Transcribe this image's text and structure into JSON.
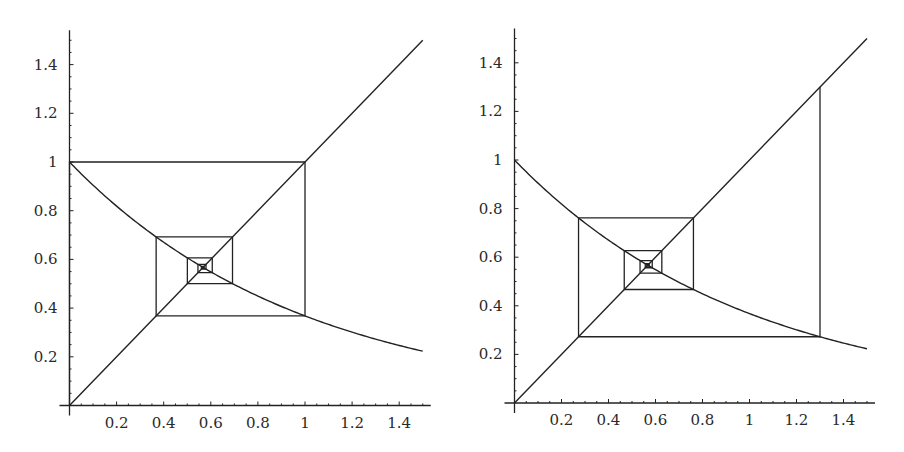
{
  "chart_data": [
    {
      "type": "line",
      "title": "",
      "xlabel": "",
      "ylabel": "",
      "xlim": [
        0,
        1.5
      ],
      "ylim": [
        0,
        1.5
      ],
      "grid": false,
      "x_ticks": [
        "0.2",
        "0.4",
        "0.6",
        "0.8",
        "1",
        "1.2",
        "1.4"
      ],
      "y_ticks": [
        "0.2",
        "0.4",
        "0.6",
        "0.8",
        "1",
        "1.2",
        "1.4"
      ],
      "series": [
        {
          "name": "y = x",
          "x": [
            0,
            1.5
          ],
          "y": [
            0,
            1.5
          ]
        },
        {
          "name": "y = e^(-x)",
          "x": [
            0,
            0.25,
            0.5,
            0.75,
            1.0,
            1.25,
            1.5
          ],
          "y": [
            1.0,
            0.779,
            0.607,
            0.472,
            0.368,
            0.287,
            0.223
          ]
        },
        {
          "name": "cobweb iteration",
          "x0": 0.0,
          "iterates": [
            0.0,
            1.0,
            0.368,
            0.692,
            0.5,
            0.606,
            0.545,
            0.58,
            0.56,
            0.571,
            0.565,
            0.568
          ]
        }
      ],
      "fixed_point": 0.567
    },
    {
      "type": "line",
      "title": "",
      "xlabel": "",
      "ylabel": "",
      "xlim": [
        0,
        1.5
      ],
      "ylim": [
        0,
        1.5
      ],
      "grid": false,
      "x_ticks": [
        "0.2",
        "0.4",
        "0.6",
        "0.8",
        "1",
        "1.2",
        "1.4"
      ],
      "y_ticks": [
        "0.2",
        "0.4",
        "0.6",
        "0.8",
        "1",
        "1.2",
        "1.4"
      ],
      "series": [
        {
          "name": "y = x",
          "x": [
            0,
            1.5
          ],
          "y": [
            0,
            1.5
          ]
        },
        {
          "name": "y = e^(-x)",
          "x": [
            0,
            0.25,
            0.5,
            0.75,
            1.0,
            1.25,
            1.5
          ],
          "y": [
            1.0,
            0.779,
            0.607,
            0.472,
            0.368,
            0.287,
            0.223
          ]
        },
        {
          "name": "cobweb iteration",
          "x0": 1.3,
          "iterates": [
            1.3,
            0.273,
            0.761,
            0.467,
            0.627,
            0.534,
            0.586,
            0.556,
            0.573,
            0.564,
            0.569
          ]
        }
      ],
      "fixed_point": 0.567
    }
  ],
  "panels": [
    {
      "origin_px": [
        69.5,
        405.5
      ],
      "x_unit_px": 235.5,
      "y_unit_px": 243.5
    },
    {
      "origin_px": [
        64.5,
        403
      ],
      "x_unit_px": 235,
      "y_unit_px": 243
    }
  ]
}
